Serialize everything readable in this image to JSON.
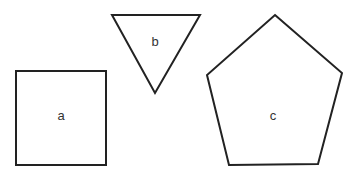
{
  "diagram": {
    "stroke_color": "#222222",
    "label_color": "#333333",
    "background": "#ffffff",
    "shapes": [
      {
        "type": "square",
        "label": "a",
        "points": "16,71 106,71 106,165 16,165",
        "label_pos": [
          61,
          117
        ]
      },
      {
        "type": "triangle",
        "label": "b",
        "points": "112,15 200,15 155,93",
        "label_pos": [
          155,
          43
        ]
      },
      {
        "type": "pentagon",
        "label": "c",
        "points": "275,15 342,73 318,164 229,165 207,75",
        "label_pos": [
          273,
          117
        ]
      }
    ]
  }
}
